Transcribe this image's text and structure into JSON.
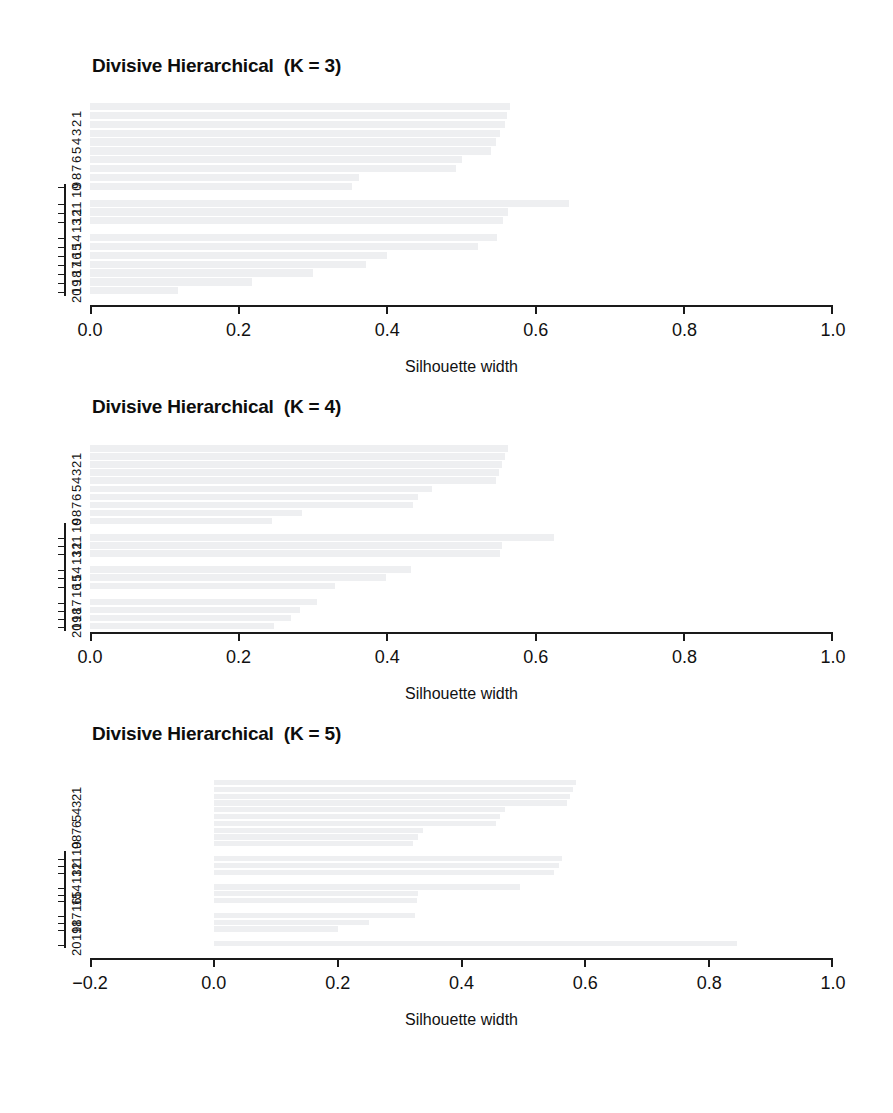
{
  "figure": {
    "background": "#ffffff",
    "bar_color": "#eeeff1",
    "axis_color": "#1a1a1a",
    "xlabel": "Silhouette width"
  },
  "chart_data": [
    {
      "type": "bar",
      "orientation": "horizontal",
      "title": "Divisive Hierarchical  (K = 3)",
      "xlabel": "Silhouette width",
      "ylabel": "",
      "xlim": [
        0.0,
        1.0
      ],
      "xticks": [
        0.0,
        0.2,
        0.4,
        0.6,
        0.8,
        1.0
      ],
      "xticklabels": [
        "0.0",
        "0.2",
        "0.4",
        "0.6",
        "0.8",
        "1.0"
      ],
      "yticklabels": [
        "1",
        "2",
        "3",
        "4",
        "5",
        "6",
        "7",
        "8",
        "9",
        "10",
        "11",
        "12",
        "13",
        "14",
        "15",
        "16",
        "17",
        "18",
        "19",
        "20"
      ],
      "grid": false,
      "legend": false,
      "categories": [
        "1",
        "2",
        "3",
        "4",
        "5",
        "6",
        "7",
        "8",
        "9",
        "10",
        "11",
        "12",
        "13",
        "14",
        "15",
        "16",
        "17",
        "18",
        "19",
        "20"
      ],
      "values": [
        0.565,
        0.561,
        0.558,
        0.552,
        0.546,
        0.54,
        0.5,
        0.492,
        0.362,
        0.352,
        0.645,
        0.562,
        0.556,
        0.548,
        0.522,
        0.4,
        0.372,
        0.3,
        0.218,
        0.118
      ],
      "clusters": [
        {
          "label": "cluster 1",
          "members": [
            "1",
            "2",
            "3",
            "4",
            "5",
            "6",
            "7",
            "8",
            "9",
            "10"
          ]
        },
        {
          "label": "cluster 2",
          "members": [
            "11",
            "12",
            "13"
          ]
        },
        {
          "label": "cluster 3",
          "members": [
            "14",
            "15",
            "16",
            "17",
            "18",
            "19",
            "20"
          ]
        }
      ]
    },
    {
      "type": "bar",
      "orientation": "horizontal",
      "title": "Divisive Hierarchical  (K = 4)",
      "xlabel": "Silhouette width",
      "ylabel": "",
      "xlim": [
        0.0,
        1.0
      ],
      "xticks": [
        0.0,
        0.2,
        0.4,
        0.6,
        0.8,
        1.0
      ],
      "xticklabels": [
        "0.0",
        "0.2",
        "0.4",
        "0.6",
        "0.8",
        "1.0"
      ],
      "yticklabels": [
        "1",
        "2",
        "3",
        "4",
        "5",
        "6",
        "7",
        "8",
        "9",
        "10",
        "11",
        "12",
        "13",
        "14",
        "15",
        "16",
        "17",
        "18",
        "19",
        "20"
      ],
      "grid": false,
      "legend": false,
      "categories": [
        "1",
        "2",
        "3",
        "4",
        "5",
        "6",
        "7",
        "8",
        "9",
        "10",
        "11",
        "12",
        "13",
        "14",
        "15",
        "16",
        "17",
        "18",
        "19",
        "20"
      ],
      "values": [
        0.562,
        0.558,
        0.554,
        0.55,
        0.546,
        0.46,
        0.442,
        0.435,
        0.285,
        0.245,
        0.625,
        0.555,
        0.552,
        0.432,
        0.398,
        0.33,
        0.305,
        0.282,
        0.27,
        0.248
      ],
      "clusters": [
        {
          "label": "cluster 1",
          "members": [
            "1",
            "2",
            "3",
            "4",
            "5",
            "6",
            "7",
            "8",
            "9",
            "10"
          ]
        },
        {
          "label": "cluster 2",
          "members": [
            "11",
            "12",
            "13"
          ]
        },
        {
          "label": "cluster 3",
          "members": [
            "14",
            "15",
            "16"
          ]
        },
        {
          "label": "cluster 4",
          "members": [
            "17",
            "18",
            "19",
            "20"
          ]
        }
      ]
    },
    {
      "type": "bar",
      "orientation": "horizontal",
      "title": "Divisive Hierarchical  (K = 5)",
      "xlabel": "Silhouette width",
      "ylabel": "",
      "xlim": [
        -0.2,
        1.0
      ],
      "xticks": [
        -0.2,
        0.0,
        0.2,
        0.4,
        0.6,
        0.8,
        1.0
      ],
      "xticklabels": [
        "−0.2",
        "0.0",
        "0.2",
        "0.4",
        "0.6",
        "0.8",
        "1.0"
      ],
      "yticklabels": [
        "1",
        "2",
        "3",
        "4",
        "5",
        "6",
        "7",
        "8",
        "9",
        "10",
        "11",
        "12",
        "13",
        "14",
        "15",
        "16",
        "17",
        "18",
        "19",
        "20"
      ],
      "grid": false,
      "legend": false,
      "categories": [
        "1",
        "2",
        "3",
        "4",
        "5",
        "6",
        "7",
        "8",
        "9",
        "10",
        "11",
        "12",
        "13",
        "14",
        "15",
        "16",
        "17",
        "18",
        "19",
        "20"
      ],
      "values": [
        0.585,
        0.58,
        0.575,
        0.57,
        0.47,
        0.462,
        0.455,
        0.338,
        0.33,
        0.322,
        0.562,
        0.558,
        0.55,
        0.495,
        0.33,
        0.328,
        0.325,
        0.25,
        0.2,
        0.845
      ],
      "clusters": [
        {
          "label": "cluster 1",
          "members": [
            "1",
            "2",
            "3",
            "4",
            "5",
            "6",
            "7",
            "8",
            "9",
            "10"
          ]
        },
        {
          "label": "cluster 2",
          "members": [
            "11",
            "12",
            "13"
          ]
        },
        {
          "label": "cluster 3",
          "members": [
            "14",
            "15",
            "16"
          ]
        },
        {
          "label": "cluster 4",
          "members": [
            "17",
            "18",
            "19"
          ]
        },
        {
          "label": "cluster 5",
          "members": [
            "20"
          ]
        }
      ]
    }
  ]
}
